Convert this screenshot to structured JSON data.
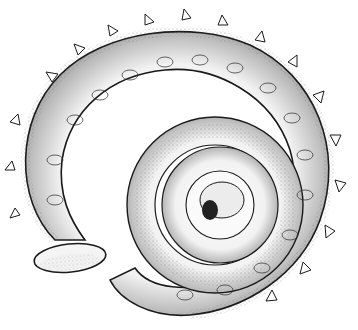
{
  "image": {
    "subject": "stippled illustration of a spiral ammonite fossil",
    "colors": {
      "background": "#ffffff",
      "ink": "#1a1a1a",
      "shade": "#555555"
    }
  }
}
